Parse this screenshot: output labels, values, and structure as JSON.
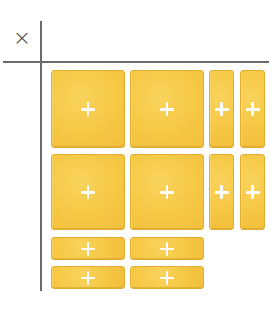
{
  "diagram": {
    "operator_symbol": "×",
    "tile_color": "#F6C845",
    "tile_border_color": "#E2AD2F",
    "sign_color": "#FFFFFF",
    "axis_color": "#6A6A6A",
    "tiles": [
      {
        "id": "x2-r1-c1",
        "kind": "x-squared",
        "sign": "+",
        "left": 51,
        "top": 70,
        "width": 74,
        "height": 78
      },
      {
        "id": "x2-r1-c2",
        "kind": "x-squared",
        "sign": "+",
        "left": 130,
        "top": 70,
        "width": 74,
        "height": 78
      },
      {
        "id": "x-r1-c3",
        "kind": "x-vertical",
        "sign": "+",
        "left": 209,
        "top": 70,
        "width": 25,
        "height": 78
      },
      {
        "id": "x-r1-c4",
        "kind": "x-vertical",
        "sign": "+",
        "left": 240,
        "top": 70,
        "width": 25,
        "height": 78
      },
      {
        "id": "x2-r2-c1",
        "kind": "x-squared",
        "sign": "+",
        "left": 51,
        "top": 154,
        "width": 74,
        "height": 76
      },
      {
        "id": "x2-r2-c2",
        "kind": "x-squared",
        "sign": "+",
        "left": 130,
        "top": 154,
        "width": 74,
        "height": 76
      },
      {
        "id": "x-r2-c3",
        "kind": "x-vertical",
        "sign": "+",
        "left": 209,
        "top": 154,
        "width": 25,
        "height": 76
      },
      {
        "id": "x-r2-c4",
        "kind": "x-vertical",
        "sign": "+",
        "left": 240,
        "top": 154,
        "width": 25,
        "height": 76
      },
      {
        "id": "x-r3-c1",
        "kind": "x-horizontal",
        "sign": "+",
        "left": 51,
        "top": 237,
        "width": 74,
        "height": 23
      },
      {
        "id": "x-r3-c2",
        "kind": "x-horizontal",
        "sign": "+",
        "left": 130,
        "top": 237,
        "width": 74,
        "height": 23
      },
      {
        "id": "x-r4-c1",
        "kind": "x-horizontal",
        "sign": "+",
        "left": 51,
        "top": 266,
        "width": 74,
        "height": 23
      },
      {
        "id": "x-r4-c2",
        "kind": "x-horizontal",
        "sign": "+",
        "left": 130,
        "top": 266,
        "width": 74,
        "height": 23
      }
    ]
  }
}
